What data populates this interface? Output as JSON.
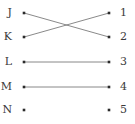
{
  "diagram": {
    "type": "bipartite-mapping",
    "width": 135,
    "height": 124,
    "background_color": "#ffffff",
    "edge_color": "#6b6b6b",
    "node_color": "#2b2b2b",
    "label_color": "#3a3a3a",
    "edge_width": 0.8,
    "node_size": 2.6,
    "left_column": {
      "label_x": 12,
      "dot_x": 24,
      "nodes": [
        {
          "id": "J",
          "label": "J",
          "y": 13
        },
        {
          "id": "K",
          "label": "K",
          "y": 37
        },
        {
          "id": "L",
          "label": "L",
          "y": 62
        },
        {
          "id": "M",
          "label": "M",
          "y": 87
        },
        {
          "id": "N",
          "label": "N",
          "y": 110
        }
      ]
    },
    "right_column": {
      "label_x": 120,
      "dot_x": 109,
      "nodes": [
        {
          "id": "1",
          "label": "1",
          "y": 13
        },
        {
          "id": "2",
          "label": "2",
          "y": 37
        },
        {
          "id": "3",
          "label": "3",
          "y": 62
        },
        {
          "id": "4",
          "label": "4",
          "y": 87
        },
        {
          "id": "5",
          "label": "5",
          "y": 110
        }
      ]
    },
    "edges": [
      {
        "from": "J",
        "to": "2",
        "x1": 24,
        "y1": 13,
        "x2": 109,
        "y2": 37
      },
      {
        "from": "K",
        "to": "1",
        "x1": 24,
        "y1": 37,
        "x2": 109,
        "y2": 13
      },
      {
        "from": "L",
        "to": "3",
        "x1": 24,
        "y1": 62,
        "x2": 109,
        "y2": 62
      },
      {
        "from": "M",
        "to": "4",
        "x1": 24,
        "y1": 87,
        "x2": 109,
        "y2": 87
      }
    ],
    "unconnected": [
      "N",
      "5"
    ]
  }
}
